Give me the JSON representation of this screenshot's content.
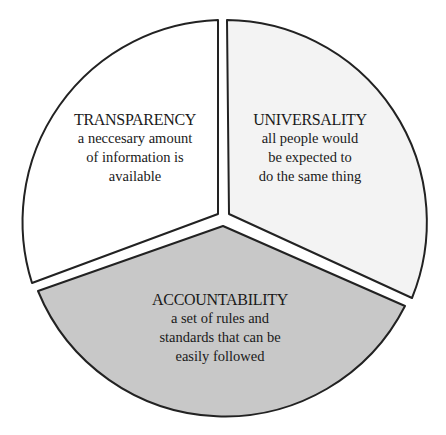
{
  "diagram": {
    "type": "segmented-circle",
    "segments": [
      {
        "id": "transparency",
        "title": "TRANSPARENCY",
        "description_lines": [
          "a neccesary amount",
          "of information is",
          "available"
        ],
        "fill": "#ffffff"
      },
      {
        "id": "universality",
        "title": "UNIVERSALITY",
        "description_lines": [
          "all people would",
          "be expected to",
          "do the same thing"
        ],
        "fill": "#f3f3f3"
      },
      {
        "id": "accountability",
        "title": "ACCOUNTABILITY",
        "description_lines": [
          "a set of rules and",
          "standards that can be",
          "easily followed"
        ],
        "fill": "#c8c8c8"
      }
    ],
    "stroke_color": "#222222"
  }
}
